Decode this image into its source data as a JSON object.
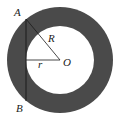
{
  "diagram": {
    "colors": {
      "ring": "#4a4a4a",
      "inner": "#ffffff",
      "line": "#1a1a1a",
      "background": "#ffffff"
    },
    "center": {
      "label": "O",
      "x": 60,
      "y": 60
    },
    "outer_circle": {
      "radius": 53,
      "label": "R"
    },
    "inner_circle": {
      "radius": 34,
      "label": "r"
    },
    "chord": {
      "from": "A",
      "to": "B",
      "x": 26,
      "y1": 19,
      "y2": 101
    },
    "points": [
      {
        "label": "A",
        "x": 26,
        "y": 19
      },
      {
        "label": "B",
        "x": 26,
        "y": 101
      },
      {
        "label": "O",
        "x": 60,
        "y": 60
      }
    ],
    "labels": {
      "A": "A",
      "B": "B",
      "O": "O",
      "R": "R",
      "r": "r"
    }
  }
}
